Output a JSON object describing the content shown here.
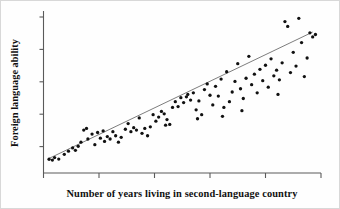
{
  "figure": {
    "background_color": "#fefefe",
    "point_color": "#111111",
    "line_color": "#6e6e6e",
    "axis_color": "#5a5a5a"
  },
  "chart_data": {
    "type": "scatter",
    "title": "",
    "xlabel": "Number of years living in second-language country",
    "ylabel": "Foreign language ability",
    "grid": false,
    "legend": false,
    "tick_labels": {
      "x": [],
      "y": []
    },
    "x_tick_count": 6,
    "y_tick_count": 5,
    "xlim": [
      0,
      100
    ],
    "ylim": [
      0,
      100
    ],
    "trendline": {
      "type": "linear",
      "x": [
        2,
        97
      ],
      "y": [
        9,
        87
      ],
      "description": "positive linear best-fit line"
    },
    "points": [
      [
        2.0,
        8.5
      ],
      [
        3.2,
        8.0
      ],
      [
        4.0,
        9.5
      ],
      [
        5.5,
        8.6
      ],
      [
        7.5,
        11.5
      ],
      [
        9.0,
        13.5
      ],
      [
        10.5,
        15.5
      ],
      [
        11.5,
        14.0
      ],
      [
        12.5,
        16.5
      ],
      [
        13.5,
        19.0
      ],
      [
        14.5,
        26.5
      ],
      [
        15.5,
        27.5
      ],
      [
        16.0,
        21.0
      ],
      [
        17.5,
        24.0
      ],
      [
        18.5,
        17.5
      ],
      [
        19.5,
        25.0
      ],
      [
        20.5,
        21.5
      ],
      [
        21.5,
        26.0
      ],
      [
        22.0,
        19.5
      ],
      [
        23.0,
        22.5
      ],
      [
        24.0,
        21.0
      ],
      [
        25.0,
        25.5
      ],
      [
        26.0,
        23.0
      ],
      [
        27.0,
        19.0
      ],
      [
        28.0,
        22.0
      ],
      [
        29.5,
        27.0
      ],
      [
        30.5,
        30.5
      ],
      [
        31.5,
        25.5
      ],
      [
        32.5,
        28.0
      ],
      [
        33.5,
        26.5
      ],
      [
        34.5,
        34.0
      ],
      [
        35.5,
        24.5
      ],
      [
        36.5,
        27.5
      ],
      [
        37.5,
        23.0
      ],
      [
        38.5,
        28.5
      ],
      [
        39.5,
        36.0
      ],
      [
        40.5,
        32.0
      ],
      [
        41.5,
        34.5
      ],
      [
        42.5,
        38.0
      ],
      [
        43.5,
        36.5
      ],
      [
        44.5,
        33.0
      ],
      [
        45.5,
        30.0
      ],
      [
        46.5,
        40.5
      ],
      [
        47.5,
        44.0
      ],
      [
        48.5,
        41.0
      ],
      [
        49.5,
        46.5
      ],
      [
        50.5,
        43.5
      ],
      [
        51.5,
        47.0
      ],
      [
        52.0,
        48.5
      ],
      [
        53.0,
        45.0
      ],
      [
        54.0,
        49.5
      ],
      [
        55.0,
        39.0
      ],
      [
        56.0,
        44.5
      ],
      [
        57.0,
        36.0
      ],
      [
        58.0,
        51.5
      ],
      [
        59.0,
        55.0
      ],
      [
        60.0,
        48.0
      ],
      [
        61.0,
        42.0
      ],
      [
        62.0,
        53.5
      ],
      [
        63.0,
        47.5
      ],
      [
        64.0,
        58.0
      ],
      [
        65.0,
        40.5
      ],
      [
        66.0,
        62.5
      ],
      [
        67.0,
        44.0
      ],
      [
        68.0,
        50.0
      ],
      [
        69.0,
        56.5
      ],
      [
        70.0,
        67.5
      ],
      [
        71.0,
        52.0
      ],
      [
        72.0,
        46.0
      ],
      [
        73.0,
        58.5
      ],
      [
        74.0,
        72.0
      ],
      [
        75.0,
        54.5
      ],
      [
        76.0,
        61.0
      ],
      [
        77.0,
        49.5
      ],
      [
        78.0,
        64.0
      ],
      [
        79.0,
        57.0
      ],
      [
        80.0,
        66.5
      ],
      [
        81.0,
        53.0
      ],
      [
        82.0,
        70.5
      ],
      [
        83.0,
        60.0
      ],
      [
        84.0,
        63.5
      ],
      [
        85.0,
        57.5
      ],
      [
        86.0,
        68.0
      ],
      [
        87.0,
        93.5
      ],
      [
        88.0,
        90.5
      ],
      [
        89.0,
        62.0
      ],
      [
        90.0,
        74.5
      ],
      [
        91.0,
        66.0
      ],
      [
        92.0,
        95.5
      ],
      [
        93.0,
        80.5
      ],
      [
        94.0,
        59.5
      ],
      [
        95.0,
        71.0
      ],
      [
        96.0,
        86.5
      ],
      [
        97.0,
        84.0
      ],
      [
        98.0,
        85.5
      ],
      [
        44.0,
        29.5
      ],
      [
        55.5,
        33.5
      ],
      [
        64.5,
        35.0
      ],
      [
        71.5,
        38.5
      ],
      [
        84.5,
        48.5
      ]
    ]
  }
}
